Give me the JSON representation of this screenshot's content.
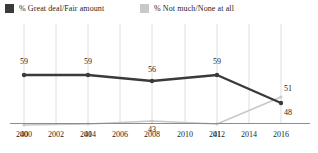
{
  "legend": {
    "position": "top-left",
    "items": [
      {
        "label": "% Great deal/Fair amount",
        "color": "#3a3a3a",
        "swatch_name": "legend-swatch-great-deal"
      },
      {
        "label": "% Not much/None at all",
        "color": "#c8c8c8",
        "swatch_name": "legend-swatch-not-much"
      }
    ]
  },
  "chart_data": {
    "type": "line",
    "title": "",
    "subtitle": "",
    "xlabel": "",
    "ylabel": "",
    "x": [
      2000,
      2004,
      2008,
      2012,
      2016
    ],
    "tick_labels": [
      "2000",
      "2002",
      "2004",
      "2006",
      "2008",
      "2010",
      "2012",
      "2014",
      "2016"
    ],
    "xlim": [
      2000,
      2016
    ],
    "ylim": [
      0,
      70
    ],
    "grid": "vertical",
    "legend_position": "top-left",
    "series": [
      {
        "name": "% Great deal/Fair amount",
        "color": "#3a3a3a",
        "values": [
          59,
          59,
          56,
          59,
          48
        ],
        "labels": [
          "59",
          "59",
          "56",
          "59",
          "48"
        ]
      },
      {
        "name": "% Not much/None at all",
        "color": "#c8c8c8",
        "values": [
          40,
          41,
          43,
          41,
          51
        ],
        "labels": [
          "40",
          "41",
          "43",
          "41",
          "51"
        ]
      }
    ]
  },
  "axis": {
    "ticks": [
      {
        "label": "2000",
        "x": 24
      },
      {
        "label": "2002",
        "x": 56
      },
      {
        "label": "2004",
        "x": 88
      },
      {
        "label": "2006",
        "x": 120
      },
      {
        "label": "2008",
        "x": 152
      },
      {
        "label": "2010",
        "x": 185
      },
      {
        "label": "2012",
        "x": 217
      },
      {
        "label": "2014",
        "x": 249
      },
      {
        "label": "2016",
        "x": 281
      }
    ]
  },
  "points": {
    "series_0": [
      {
        "label": "59",
        "px": 24,
        "py": 51,
        "lx": 24,
        "ly": 33
      },
      {
        "label": "59",
        "px": 88,
        "py": 51,
        "lx": 88,
        "ly": 33
      },
      {
        "label": "56",
        "px": 152,
        "py": 57,
        "lx": 152,
        "ly": 41
      },
      {
        "label": "59",
        "px": 217,
        "py": 51,
        "lx": 217,
        "ly": 33
      },
      {
        "label": "48",
        "px": 281,
        "py": 79,
        "lx": 288,
        "ly": 84
      }
    ],
    "series_1": [
      {
        "label": "40",
        "px": 24,
        "py": 101,
        "lx": 24,
        "ly": 106
      },
      {
        "label": "41",
        "px": 88,
        "py": 100,
        "lx": 88,
        "ly": 106
      },
      {
        "label": "43",
        "px": 152,
        "py": 97,
        "lx": 152,
        "ly": 101
      },
      {
        "label": "41",
        "px": 217,
        "py": 100,
        "lx": 217,
        "ly": 106
      },
      {
        "label": "51",
        "px": 281,
        "py": 73,
        "lx": 288,
        "ly": 60
      }
    ]
  },
  "colors": {
    "series_dark": "#3a3a3a",
    "series_light": "#c8c8c8",
    "gridline": "#d6d6d6",
    "axis": "#8c8c8c",
    "text": "#262626"
  }
}
